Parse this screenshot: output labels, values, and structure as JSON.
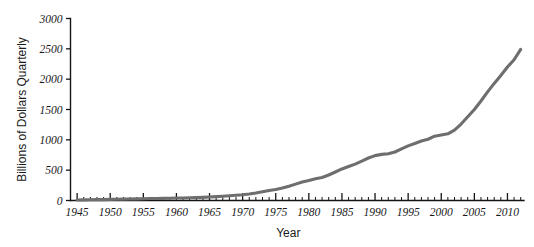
{
  "chart_data": {
    "type": "line",
    "title": "",
    "xlabel": "Year",
    "ylabel": "Billions of Dollars Quarterly",
    "xlim": [
      1944,
      2012.5
    ],
    "ylim": [
      0,
      3000
    ],
    "grid": false,
    "legend": null,
    "line_color": "#6e6e6e",
    "x_ticks": [
      1945,
      1950,
      1955,
      1960,
      1965,
      1970,
      1975,
      1980,
      1985,
      1990,
      1995,
      2000,
      2005,
      2010
    ],
    "x_tick_labels": [
      "1945",
      "1950",
      "1955",
      "1960",
      "1965",
      "1970",
      "1975",
      "1980",
      "1985",
      "1990",
      "1995",
      "2000",
      "2005",
      "2010"
    ],
    "x_minor_tick_step": 1,
    "y_ticks": [
      0,
      500,
      1000,
      1500,
      2000,
      2500,
      3000
    ],
    "y_tick_labels": [
      "0",
      "500",
      "1000",
      "1500",
      "2000",
      "2500",
      "3000"
    ],
    "series": [
      {
        "name": "Billions of Dollars Quarterly",
        "x": [
          1945,
          1946,
          1947,
          1948,
          1949,
          1950,
          1951,
          1952,
          1953,
          1954,
          1955,
          1956,
          1957,
          1958,
          1959,
          1960,
          1961,
          1962,
          1963,
          1964,
          1965,
          1966,
          1967,
          1968,
          1969,
          1970,
          1971,
          1972,
          1973,
          1974,
          1975,
          1976,
          1977,
          1978,
          1979,
          1980,
          1981,
          1982,
          1983,
          1984,
          1985,
          1986,
          1987,
          1988,
          1989,
          1990,
          1991,
          1992,
          1993,
          1994,
          1995,
          1996,
          1997,
          1998,
          1999,
          2000,
          2001,
          2002,
          2003,
          2004,
          2005,
          2006,
          2007,
          2008,
          2009,
          2010,
          2011,
          2012
        ],
        "values": [
          8,
          10,
          12,
          14,
          15,
          18,
          20,
          22,
          24,
          26,
          30,
          32,
          34,
          35,
          38,
          40,
          42,
          45,
          48,
          52,
          58,
          64,
          70,
          78,
          86,
          95,
          108,
          125,
          145,
          165,
          180,
          205,
          235,
          270,
          305,
          330,
          360,
          380,
          420,
          470,
          520,
          560,
          600,
          650,
          700,
          740,
          760,
          770,
          800,
          850,
          900,
          940,
          980,
          1010,
          1060,
          1080,
          1100,
          1160,
          1260,
          1380,
          1500,
          1640,
          1790,
          1930,
          2060,
          2200,
          2320,
          2490
        ]
      }
    ]
  }
}
